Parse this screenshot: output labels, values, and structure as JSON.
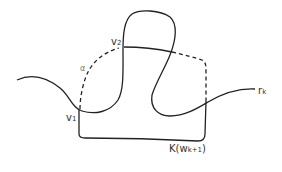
{
  "diagram": {
    "labels": {
      "v1": "v",
      "v1_sub": "1",
      "v2": "v",
      "v2_sub": "2",
      "alpha": "α",
      "rk": "r",
      "rk_sub": "k",
      "k_label": "K(w",
      "k_sub": "k+1",
      "k_close": ")"
    },
    "colors": {
      "stroke": "#222222",
      "background": "#ffffff"
    },
    "curves": [
      {
        "name": "r_k",
        "style": "solid"
      },
      {
        "name": "alpha",
        "style": "dashed"
      },
      {
        "name": "K(w_{k+1}) boundary",
        "style": "solid + dashed"
      }
    ]
  }
}
